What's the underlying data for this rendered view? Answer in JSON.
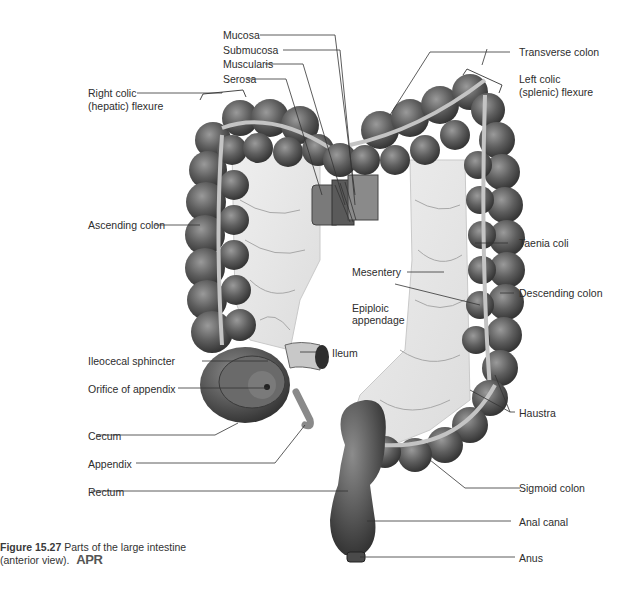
{
  "figure": {
    "number": "Figure 15.27",
    "caption_line1": "Parts of the large intestine",
    "caption_line2": "(anterior view).",
    "badge": "APR"
  },
  "labels": {
    "mucosa": "Mucosa",
    "submucosa": "Submucosa",
    "muscularis": "Muscularis",
    "serosa": "Serosa",
    "transverse_colon": "Transverse colon",
    "left_colic_1": "Left colic",
    "left_colic_2": "(splenic) flexure",
    "right_colic_1": "Right colic",
    "right_colic_2": "(hepatic) flexure",
    "ascending_colon": "Ascending colon",
    "taenia_coli": "Taenia coli",
    "mesentery": "Mesentery",
    "descending_colon": "Descending colon",
    "epiploic_1": "Epiploic",
    "epiploic_2": "appendage",
    "ileocecal_sphincter": "Ileocecal sphincter",
    "ileum": "Ileum",
    "orifice_of_appendix": "Orifice of appendix",
    "haustra": "Haustra",
    "cecum": "Cecum",
    "appendix": "Appendix",
    "rectum": "Rectum",
    "sigmoid_colon": "Sigmoid colon",
    "anal_canal": "Anal canal",
    "anus": "Anus"
  },
  "colors": {
    "colon_dark": "#4a4a4a",
    "colon_mid": "#6e6e6e",
    "mesentery": "#e6e6e6",
    "taenia": "#bdbdbd",
    "leader_line": "#333333"
  }
}
